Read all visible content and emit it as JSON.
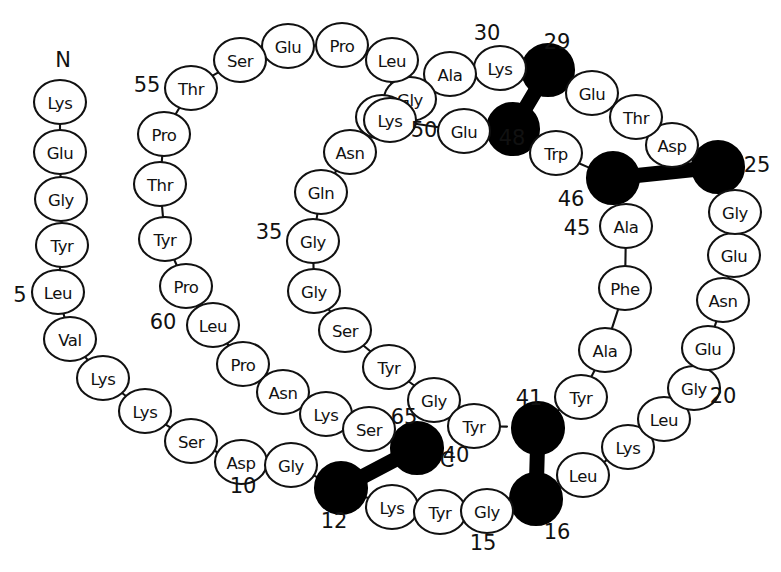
{
  "figure": {
    "type": "protein-sequence-diagram",
    "total_residues": 65,
    "colors": {
      "background": "#ffffff",
      "stroke": "#111111",
      "filled_residue": "#000000"
    }
  },
  "terminus_labels": [
    {
      "text": "N",
      "x": 63,
      "y": 60
    },
    {
      "text": "C",
      "x": 447,
      "y": 460
    }
  ],
  "number_labels": [
    {
      "text": "5",
      "x": 20,
      "y": 295
    },
    {
      "text": "10",
      "x": 243,
      "y": 486
    },
    {
      "text": "12",
      "x": 334,
      "y": 521
    },
    {
      "text": "15",
      "x": 483,
      "y": 543
    },
    {
      "text": "16",
      "x": 557,
      "y": 532
    },
    {
      "text": "20",
      "x": 723,
      "y": 396
    },
    {
      "text": "25",
      "x": 757,
      "y": 165
    },
    {
      "text": "29",
      "x": 557,
      "y": 42
    },
    {
      "text": "30",
      "x": 487,
      "y": 33
    },
    {
      "text": "35",
      "x": 269,
      "y": 232
    },
    {
      "text": "40",
      "x": 456,
      "y": 455
    },
    {
      "text": "41",
      "x": 529,
      "y": 398
    },
    {
      "text": "45",
      "x": 577,
      "y": 228
    },
    {
      "text": "46",
      "x": 571,
      "y": 199
    },
    {
      "text": "48",
      "x": 512,
      "y": 138
    },
    {
      "text": "50",
      "x": 424,
      "y": 130
    },
    {
      "text": "55",
      "x": 147,
      "y": 85
    },
    {
      "text": "60",
      "x": 163,
      "y": 322
    },
    {
      "text": "65",
      "x": 404,
      "y": 417
    }
  ],
  "residues": [
    {
      "n": 1,
      "label": "Lys",
      "x": 60,
      "y": 102,
      "filled": false
    },
    {
      "n": 2,
      "label": "Glu",
      "x": 60,
      "y": 152,
      "filled": false
    },
    {
      "n": 3,
      "label": "Gly",
      "x": 61,
      "y": 199,
      "filled": false
    },
    {
      "n": 4,
      "label": "Tyr",
      "x": 62,
      "y": 245,
      "filled": false
    },
    {
      "n": 5,
      "label": "Leu",
      "x": 58,
      "y": 292,
      "filled": false
    },
    {
      "n": 6,
      "label": "Val",
      "x": 70,
      "y": 339,
      "filled": false
    },
    {
      "n": 7,
      "label": "Lys",
      "x": 103,
      "y": 378,
      "filled": false
    },
    {
      "n": 8,
      "label": "Lys",
      "x": 145,
      "y": 411,
      "filled": false
    },
    {
      "n": 9,
      "label": "Ser",
      "x": 191,
      "y": 441,
      "filled": false
    },
    {
      "n": 10,
      "label": "Asp",
      "x": 241,
      "y": 462,
      "filled": false
    },
    {
      "n": 11,
      "label": "Gly",
      "x": 291,
      "y": 465,
      "filled": false
    },
    {
      "n": 12,
      "label": "Cys",
      "x": 341,
      "y": 488,
      "filled": true
    },
    {
      "n": 13,
      "label": "Lys",
      "x": 392,
      "y": 507,
      "filled": false
    },
    {
      "n": 14,
      "label": "Tyr",
      "x": 440,
      "y": 512,
      "filled": false
    },
    {
      "n": 15,
      "label": "Gly",
      "x": 487,
      "y": 511,
      "filled": false
    },
    {
      "n": 16,
      "label": "Cys",
      "x": 536,
      "y": 499,
      "filled": true
    },
    {
      "n": 17,
      "label": "Leu",
      "x": 583,
      "y": 475,
      "filled": false
    },
    {
      "n": 18,
      "label": "Lys",
      "x": 628,
      "y": 447,
      "filled": false
    },
    {
      "n": 19,
      "label": "Leu",
      "x": 664,
      "y": 419,
      "filled": false
    },
    {
      "n": 20,
      "label": "Gly",
      "x": 694,
      "y": 388,
      "filled": false
    },
    {
      "n": 21,
      "label": "Glu",
      "x": 708,
      "y": 348,
      "filled": false
    },
    {
      "n": 22,
      "label": "Asn",
      "x": 723,
      "y": 300,
      "filled": false
    },
    {
      "n": 23,
      "label": "Glu",
      "x": 734,
      "y": 255,
      "filled": false
    },
    {
      "n": 24,
      "label": "Gly",
      "x": 735,
      "y": 212,
      "filled": false
    },
    {
      "n": 25,
      "label": "Cys",
      "x": 718,
      "y": 167,
      "filled": true
    },
    {
      "n": 26,
      "label": "Asp",
      "x": 672,
      "y": 145,
      "filled": false
    },
    {
      "n": 27,
      "label": "Thr",
      "x": 636,
      "y": 117,
      "filled": false
    },
    {
      "n": 28,
      "label": "Glu",
      "x": 592,
      "y": 93,
      "filled": false
    },
    {
      "n": 29,
      "label": "Cys",
      "x": 548,
      "y": 70,
      "filled": true
    },
    {
      "n": 30,
      "label": "Lys",
      "x": 500,
      "y": 68,
      "filled": false
    },
    {
      "n": 31,
      "label": "Ala",
      "x": 450,
      "y": 74,
      "filled": false
    },
    {
      "n": 32,
      "label": "Gly",
      "x": 410,
      "y": 99,
      "filled": false
    },
    {
      "n": 33,
      "label": "Lys",
      "x": 382,
      "y": 117,
      "filled": false
    },
    {
      "n": 34,
      "label": "Asn",
      "x": 350,
      "y": 152,
      "filled": false
    },
    {
      "n": 35,
      "label": "Gln",
      "x": 321,
      "y": 192,
      "filled": false
    },
    {
      "n": 36,
      "label": "Gly",
      "x": 313,
      "y": 241,
      "filled": false
    },
    {
      "n": 37,
      "label": "Gly",
      "x": 314,
      "y": 291,
      "filled": false
    },
    {
      "n": 38,
      "label": "Ser",
      "x": 345,
      "y": 330,
      "filled": false
    },
    {
      "n": 39,
      "label": "Tyr",
      "x": 389,
      "y": 367,
      "filled": false
    },
    {
      "n": 40,
      "label": "Gly",
      "x": 434,
      "y": 400,
      "filled": false
    },
    {
      "n": 41,
      "label": "Tyr",
      "x": 474,
      "y": 426,
      "filled": false
    },
    {
      "n": 42,
      "label": "Cys",
      "x": 530,
      "y": 427,
      "filled": true
    },
    {
      "n": 43,
      "label": "Tyr",
      "x": 581,
      "y": 397,
      "filled": false
    },
    {
      "n": 44,
      "label": "Ala",
      "x": 605,
      "y": 350,
      "filled": false
    },
    {
      "n": 45,
      "label": "Phe",
      "x": 625,
      "y": 288,
      "filled": false
    },
    {
      "n": 46,
      "label": "Ala",
      "x": 626,
      "y": 226,
      "filled": false
    },
    {
      "n": 47,
      "label": "Cys",
      "x": 610,
      "y": 177,
      "filled": true
    },
    {
      "n": 48,
      "label": "Trp",
      "x": 556,
      "y": 153,
      "filled": false
    },
    {
      "n": 49,
      "label": "Cys",
      "x": 513,
      "y": 128,
      "filled": true
    },
    {
      "n": 50,
      "label": "Glu",
      "x": 464,
      "y": 131,
      "filled": false
    },
    {
      "n": 51,
      "label": "Lys",
      "x": 390,
      "y": 120,
      "filled": false
    },
    {
      "n": 52,
      "label": "Leu",
      "x": 392,
      "y": 60,
      "filled": false
    },
    {
      "n": 53,
      "label": "Pro",
      "x": 342,
      "y": 45,
      "filled": false
    },
    {
      "n": 54,
      "label": "Glu",
      "x": 288,
      "y": 46,
      "filled": false
    },
    {
      "n": 55,
      "label": "Ser",
      "x": 240,
      "y": 60,
      "filled": false
    },
    {
      "n": 56,
      "label": "Thr",
      "x": 191,
      "y": 88,
      "filled": false
    },
    {
      "n": 57,
      "label": "Pro",
      "x": 164,
      "y": 134,
      "filled": false
    },
    {
      "n": 58,
      "label": "Thr",
      "x": 160,
      "y": 184,
      "filled": false
    },
    {
      "n": 59,
      "label": "Tyr",
      "x": 165,
      "y": 239,
      "filled": false
    },
    {
      "n": 60,
      "label": "Pro",
      "x": 186,
      "y": 286,
      "filled": false
    },
    {
      "n": 61,
      "label": "Leu",
      "x": 213,
      "y": 325,
      "filled": false
    },
    {
      "n": 62,
      "label": "Pro",
      "x": 243,
      "y": 364,
      "filled": false
    },
    {
      "n": 63,
      "label": "Asn",
      "x": 283,
      "y": 392,
      "filled": false
    },
    {
      "n": 64,
      "label": "Lys",
      "x": 326,
      "y": 414,
      "filled": false
    },
    {
      "n": 65,
      "label": "Ser",
      "x": 369,
      "y": 429,
      "filled": false
    }
  ],
  "backbone_order": [
    1,
    2,
    3,
    4,
    5,
    6,
    7,
    8,
    9,
    10,
    11,
    12,
    13,
    14,
    15,
    16,
    17,
    18,
    19,
    20,
    21,
    22,
    23,
    24,
    25,
    26,
    27,
    28,
    29,
    30,
    31,
    32,
    33,
    51,
    50,
    49,
    48,
    47,
    46,
    45,
    44,
    43,
    42,
    41,
    40,
    39,
    38,
    37,
    36,
    35,
    34,
    33,
    52,
    53,
    54,
    55,
    56,
    57,
    58,
    59,
    60,
    61,
    62,
    63,
    64,
    65
  ],
  "backbone_segments": [
    [
      1,
      2
    ],
    [
      2,
      3
    ],
    [
      3,
      4
    ],
    [
      4,
      5
    ],
    [
      5,
      6
    ],
    [
      6,
      7
    ],
    [
      7,
      8
    ],
    [
      8,
      9
    ],
    [
      9,
      10
    ],
    [
      10,
      11
    ],
    [
      11,
      12
    ],
    [
      12,
      13
    ],
    [
      13,
      14
    ],
    [
      14,
      15
    ],
    [
      15,
      16
    ],
    [
      16,
      17
    ],
    [
      17,
      18
    ],
    [
      18,
      19
    ],
    [
      19,
      20
    ],
    [
      20,
      21
    ],
    [
      21,
      22
    ],
    [
      22,
      23
    ],
    [
      23,
      24
    ],
    [
      24,
      25
    ],
    [
      25,
      26
    ],
    [
      26,
      27
    ],
    [
      27,
      28
    ],
    [
      28,
      29
    ],
    [
      29,
      30
    ],
    [
      30,
      31
    ],
    [
      31,
      32
    ],
    [
      32,
      33
    ],
    [
      33,
      34
    ],
    [
      34,
      35
    ],
    [
      35,
      36
    ],
    [
      36,
      37
    ],
    [
      37,
      38
    ],
    [
      38,
      39
    ],
    [
      39,
      40
    ],
    [
      40,
      41
    ],
    [
      41,
      42
    ],
    [
      42,
      43
    ],
    [
      43,
      44
    ],
    [
      44,
      45
    ],
    [
      45,
      46
    ],
    [
      46,
      47
    ],
    [
      47,
      48
    ],
    [
      48,
      49
    ],
    [
      49,
      50
    ],
    [
      50,
      51
    ],
    [
      51,
      52
    ],
    [
      52,
      53
    ],
    [
      53,
      54
    ],
    [
      54,
      55
    ],
    [
      55,
      56
    ],
    [
      56,
      57
    ],
    [
      57,
      58
    ],
    [
      58,
      59
    ],
    [
      59,
      60
    ],
    [
      60,
      61
    ],
    [
      61,
      62
    ],
    [
      62,
      63
    ],
    [
      63,
      64
    ],
    [
      64,
      65
    ]
  ],
  "disulfide_bonds": [
    {
      "from": 12,
      "to": 42,
      "note": "solid circle 12 joined to solid circle 65-region"
    },
    {
      "from": 16,
      "to": 47,
      "note": "solid circle 16 joined vertically to 41"
    },
    {
      "from": 25,
      "to": 49,
      "note": "solid circle 25 joined horizontally to 46"
    },
    {
      "from": 29,
      "to": 47,
      "note": "solid circle 29 joined diagonally to 48"
    }
  ],
  "disulfide_pairs_drawn": [
    {
      "a_x": 341,
      "a_y": 488,
      "b_x": 417,
      "b_y": 448
    },
    {
      "a_x": 536,
      "a_y": 499,
      "b_x": 538,
      "b_y": 428
    },
    {
      "a_x": 718,
      "a_y": 167,
      "b_x": 613,
      "b_y": 178
    },
    {
      "a_x": 548,
      "a_y": 70,
      "b_x": 513,
      "b_y": 129
    }
  ],
  "filled_residue_positions": [
    {
      "x": 341,
      "y": 488,
      "num": "12"
    },
    {
      "x": 417,
      "y": 448,
      "num": "65"
    },
    {
      "x": 536,
      "y": 499,
      "num": "16"
    },
    {
      "x": 538,
      "y": 428,
      "num": "41"
    },
    {
      "x": 718,
      "y": 167,
      "num": "25"
    },
    {
      "x": 613,
      "y": 178,
      "num": "46"
    },
    {
      "x": 548,
      "y": 70,
      "num": "29"
    },
    {
      "x": 513,
      "y": 129,
      "num": "48"
    }
  ],
  "sequence_one_letter": "KEGYLVKKSDGCKYGCLKLGENEGCDTECKAGKNQGGSYGYCYAFACWCEKLPESTPTYPLPNKSC",
  "sequence_three_letter": "Lys Glu Gly Tyr Leu Val Lys Lys Ser Asp Gly Cys Lys Tyr Gly Cys Leu Lys Leu Gly Glu Asn Glu Gly Cys Asp Thr Glu Cys Lys Ala Gly Lys Asn Gln Gly Gly Ser Tyr Gly Tyr Cys Tyr Ala Phe Ala Cys Trp Cys Glu Lys Leu Pro Glu Ser Thr Pro Thr Tyr Pro Leu Pro Asn Lys Ser"
}
